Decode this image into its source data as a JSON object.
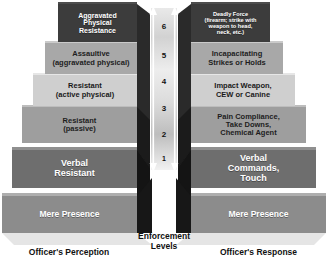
{
  "diagram": {
    "background_color": "#ffffff"
  },
  "center": {
    "caption": "Enforcement\nLevels",
    "caption_line1": "Enforcement",
    "caption_line2": "Levels",
    "arrow_top": "up-arrow",
    "arrow_bottom": "down-arrow",
    "levels": [
      "6",
      "5",
      "4",
      "3",
      "2",
      "1"
    ]
  },
  "left_column": {
    "caption": "Officer's Perception",
    "stages": [
      {
        "level": "6",
        "label": "Aggravated\nPhysical\nResistance",
        "color": "#3c3c3c"
      },
      {
        "level": "5",
        "label": "Assaultive\n(aggravated physical)",
        "color": "#a8a8a8"
      },
      {
        "level": "4",
        "label": "Resistant\n(active physical)",
        "color": "#cfcfcf"
      },
      {
        "level": "3",
        "label": "Resistant\n(passive)",
        "color": "#9e9e9e"
      },
      {
        "level": "2",
        "label": "Verbal\nResistant",
        "color": "#6e6e6e"
      },
      {
        "level": "1",
        "label": "Mere Presence",
        "color": "#8c8c8c"
      }
    ]
  },
  "right_column": {
    "caption": "Officer's Response",
    "stages": [
      {
        "level": "6",
        "label": "Deadly Force\n(firearm; strike with\nweapon to head,\nneck, etc.)",
        "color": "#3c3c3c"
      },
      {
        "level": "5",
        "label": "Incapacitating\nStrikes or Holds",
        "color": "#a8a8a8"
      },
      {
        "level": "4",
        "label": "Impact Weapon,\nCEW or Canine",
        "color": "#cfcfcf"
      },
      {
        "level": "3",
        "label": "Pain Compliance,\nTake Downs,\nChemical Agent",
        "color": "#9e9e9e"
      },
      {
        "level": "2",
        "label": "Verbal\nCommands,\nTouch",
        "color": "#6e6e6e"
      },
      {
        "level": "1",
        "label": "Mere Presence",
        "color": "#8c8c8c"
      }
    ]
  }
}
